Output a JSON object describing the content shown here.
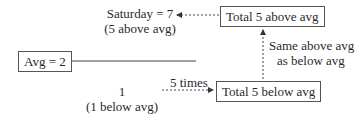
{
  "diagram": {
    "saturday_line1": "Saturday = 7",
    "saturday_line2": "(5 above avg)",
    "total_above_box": "Total 5 above avg",
    "avg_box": "Avg = 2",
    "same_line1": "Same above avg",
    "same_line2": "as below avg",
    "one_line1": "1",
    "one_line2": "(1 below avg)",
    "five_times": "5 times",
    "total_below_box": "Total 5 below avg"
  }
}
